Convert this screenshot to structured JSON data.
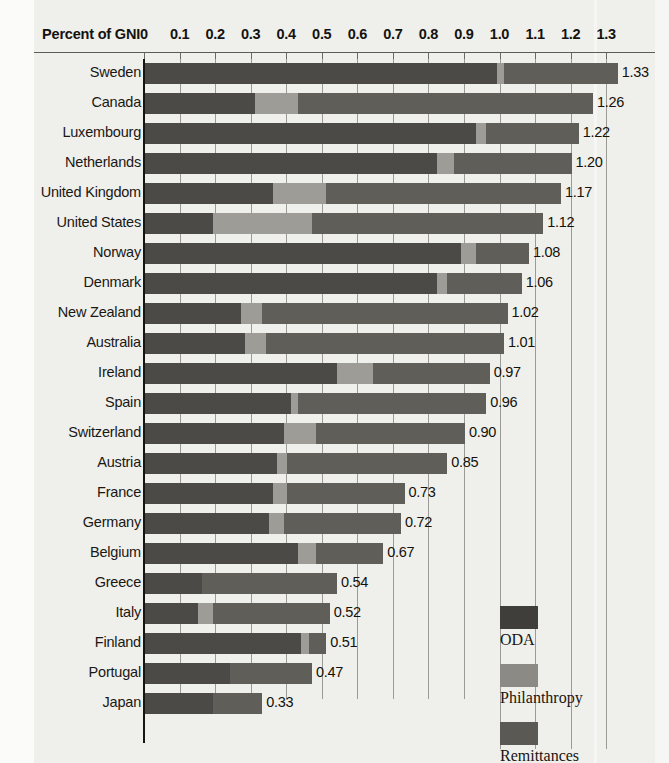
{
  "axis": {
    "title": "Percent of GNI",
    "ticks": [
      "0",
      "0.1",
      "0.2",
      "0.3",
      "0.4",
      "0.5",
      "0.6",
      "0.7",
      "0.8",
      "0.9",
      "1.0",
      "1.1",
      "1.2",
      "1.3"
    ],
    "tick_values": [
      0,
      0.1,
      0.2,
      0.3,
      0.4,
      0.5,
      0.6,
      0.7,
      0.8,
      0.9,
      1.0,
      1.1,
      1.2,
      1.3
    ],
    "min": 0,
    "max": 1.3
  },
  "legend": {
    "position": "bottom-right",
    "items": [
      {
        "key": "oda",
        "label": "ODA",
        "color": "#3f3e3a"
      },
      {
        "key": "phil",
        "label": "Philanthropy",
        "color": "#8b8a85"
      },
      {
        "key": "rem",
        "label": "Remittances",
        "color": "#5a5954"
      }
    ]
  },
  "chart_data": {
    "type": "bar",
    "orientation": "horizontal",
    "stacked": true,
    "title": "",
    "xlabel": "Percent of GNI",
    "ylabel": "",
    "xlim": [
      0,
      1.3
    ],
    "grid": true,
    "legend_position": "bottom-right",
    "categories": [
      "Sweden",
      "Canada",
      "Luxembourg",
      "Netherlands",
      "United Kingdom",
      "United States",
      "Norway",
      "Denmark",
      "New Zealand",
      "Australia",
      "Ireland",
      "Spain",
      "Switzerland",
      "Austria",
      "France",
      "Germany",
      "Belgium",
      "Greece",
      "Italy",
      "Finland",
      "Portugal",
      "Japan"
    ],
    "series": [
      {
        "name": "ODA",
        "color": "#4b4a46",
        "values": [
          0.99,
          0.31,
          0.93,
          0.82,
          0.36,
          0.19,
          0.89,
          0.82,
          0.27,
          0.28,
          0.54,
          0.41,
          0.39,
          0.37,
          0.36,
          0.35,
          0.43,
          0.16,
          0.15,
          0.44,
          0.24,
          0.19
        ]
      },
      {
        "name": "Philanthropy",
        "color": "#9d9c97",
        "values": [
          0.02,
          0.12,
          0.03,
          0.05,
          0.15,
          0.28,
          0.04,
          0.03,
          0.06,
          0.06,
          0.1,
          0.02,
          0.09,
          0.03,
          0.04,
          0.04,
          0.05,
          0.0,
          0.04,
          0.02,
          0.0,
          0.0
        ]
      },
      {
        "name": "Remittances",
        "color": "#5f5e59",
        "values": [
          0.32,
          0.83,
          0.26,
          0.33,
          0.66,
          0.65,
          0.15,
          0.21,
          0.69,
          0.67,
          0.33,
          0.53,
          0.42,
          0.45,
          0.33,
          0.33,
          0.19,
          0.38,
          0.33,
          0.05,
          0.23,
          0.14
        ]
      }
    ],
    "totals": [
      1.33,
      1.26,
      1.22,
      1.2,
      1.17,
      1.12,
      1.08,
      1.06,
      1.02,
      1.01,
      0.97,
      0.96,
      0.9,
      0.85,
      0.73,
      0.72,
      0.67,
      0.54,
      0.52,
      0.51,
      0.47,
      0.33
    ],
    "total_labels": [
      "1.33",
      "1.26",
      "1.22",
      "1.20",
      "1.17",
      "1.12",
      "1.08",
      "1.06",
      "1.02",
      "1.01",
      "0.97",
      "0.96",
      "0.90",
      "0.85",
      "0.73",
      "0.72",
      "0.67",
      "0.54",
      "0.52",
      "0.51",
      "0.47",
      "0.33"
    ]
  }
}
